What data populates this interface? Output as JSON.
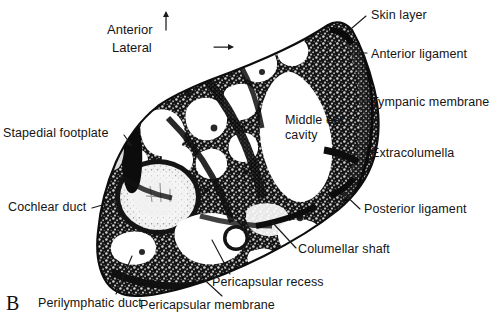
{
  "figure": {
    "panel_letter": "B",
    "background_color": "#ffffff",
    "ink_color": "#111111",
    "caption_text_color": "#151515"
  },
  "orientation": {
    "anterior": {
      "label": "Anterior",
      "arrow": "up-arrow-icon",
      "glyph": "↑"
    },
    "lateral": {
      "label": "Lateral",
      "arrow": "right-arrow-icon",
      "glyph": "→"
    }
  },
  "labels": [
    {
      "id": "skin-layer",
      "text": "Skin layer",
      "x": 371,
      "y": 8,
      "align": "left"
    },
    {
      "id": "anterior-ligament",
      "text": "Anterior ligament",
      "x": 371,
      "y": 48,
      "align": "left"
    },
    {
      "id": "tympanic-membrane",
      "text": "Tympanic membrane",
      "x": 371,
      "y": 96,
      "align": "left"
    },
    {
      "id": "middle-ear-cavity",
      "text": "Middle ear cavity",
      "x": 285,
      "y": 113,
      "align": "left",
      "multiline": true
    },
    {
      "id": "extracolumella",
      "text": "Extracolumella",
      "x": 371,
      "y": 150,
      "align": "left"
    },
    {
      "id": "posterior-ligament",
      "text": "Posterior ligament",
      "x": 364,
      "y": 205,
      "align": "left"
    },
    {
      "id": "columellar-shaft",
      "text": "Columellar shaft",
      "x": 298,
      "y": 245,
      "align": "left"
    },
    {
      "id": "pericapsular-recess",
      "text": "Pericapsular recess",
      "x": 212,
      "y": 278,
      "align": "left"
    },
    {
      "id": "pericapsular-membrane",
      "text": "Pericapsular membrane",
      "x": 140,
      "y": 300,
      "align": "left"
    },
    {
      "id": "perilymphatic-duct",
      "text": "Perilymphatic duct",
      "x": 38,
      "y": 298,
      "align": "left"
    },
    {
      "id": "cochlear-duct",
      "text": "Cochlear duct",
      "x": 8,
      "y": 202,
      "align": "left"
    },
    {
      "id": "stapedial-footplate",
      "text": "Stapedial footplate",
      "x": 3,
      "y": 128,
      "align": "left"
    }
  ],
  "specimen": {
    "name": "middle-ear-histological-section",
    "description": "Transverse histological section of middle ear region",
    "structures": [
      "middle ear cavity",
      "tympanic membrane",
      "extracolumella",
      "columellar shaft",
      "cochlear duct",
      "perilymphatic duct",
      "pericapsular recess",
      "pericapsular membrane",
      "stapedial footplate",
      "anterior ligament",
      "posterior ligament",
      "skin layer"
    ]
  }
}
